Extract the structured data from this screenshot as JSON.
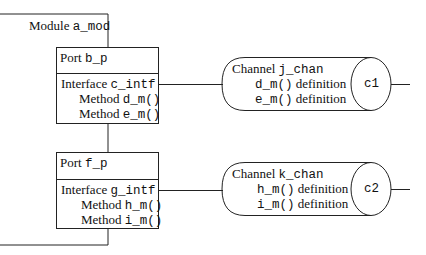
{
  "module": {
    "label": "Module",
    "name": "a_mod"
  },
  "ports": [
    {
      "label": "Port",
      "name": "b_p",
      "interface_label": "Interface",
      "interface": "c_intf",
      "methods": [
        {
          "label": "Method",
          "name": "d_m()"
        },
        {
          "label": "Method",
          "name": "e_m()"
        }
      ]
    },
    {
      "label": "Port",
      "name": "f_p",
      "interface_label": "Interface",
      "interface": "g_intf",
      "methods": [
        {
          "label": "Method",
          "name": "h_m()"
        },
        {
          "label": "Method",
          "name": "i_m()"
        }
      ]
    }
  ],
  "channels": [
    {
      "label": "Channel",
      "name": "j_chan",
      "defs": [
        {
          "name": "d_m()",
          "suffix": "definition"
        },
        {
          "name": "e_m()",
          "suffix": "definition"
        }
      ],
      "id": "c1"
    },
    {
      "label": "Channel",
      "name": "k_chan",
      "defs": [
        {
          "name": "h_m()",
          "suffix": "definition"
        },
        {
          "name": "i_m()",
          "suffix": "definition"
        }
      ],
      "id": "c2"
    }
  ]
}
